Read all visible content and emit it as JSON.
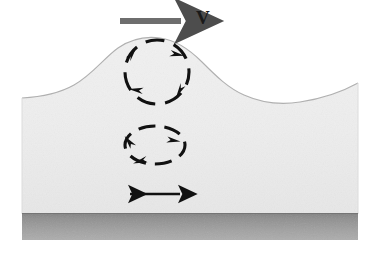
{
  "figure": {
    "background_color": "#ffffff",
    "width": 378,
    "height": 260
  },
  "water": {
    "name": "water-body",
    "fill_color": "#ececec",
    "edge_color": "#b8b8b8",
    "surface_shape": "sinusoidal wave crest",
    "left_edge_x": 22,
    "right_edge_x": 358,
    "crest_top_y": 38,
    "trough_y": 100,
    "bed_top_y": 213
  },
  "seabed": {
    "name": "seabed-layer",
    "top_color": "#8c8c8c",
    "bottom_color": "#a8a8a8",
    "top_y": 213,
    "bottom_y": 240,
    "left_x": 22,
    "right_x": 358
  },
  "velocity_arrow": {
    "name": "velocity-arrow",
    "label": "V",
    "color": "#6e6e6e",
    "head_color": "#4a4a4a",
    "start_x": 120,
    "end_x": 190,
    "y": 21,
    "direction": "right"
  },
  "upper_orbit": {
    "name": "upper-orbital-circle",
    "shape": "circle",
    "center_x": 157,
    "center_y": 72,
    "radius_x": 32,
    "radius_y": 32,
    "stroke_color": "#111111",
    "dashed": true,
    "rotation": "clockwise",
    "arrowhead_count": 4
  },
  "lower_orbit": {
    "name": "lower-orbital-ellipse",
    "shape": "ellipse",
    "center_x": 155,
    "center_y": 145,
    "radius_x": 30,
    "radius_y": 19,
    "stroke_color": "#111111",
    "dashed": true,
    "rotation": "clockwise",
    "arrowhead_count": 4
  },
  "bed_arrow": {
    "name": "bed-oscillation-arrow",
    "color": "#111111",
    "start_x": 124,
    "end_x": 186,
    "y": 194,
    "direction": "double-headed-horizontal"
  }
}
